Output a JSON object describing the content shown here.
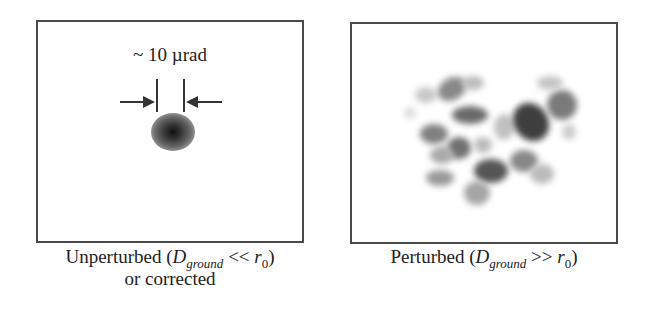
{
  "left_panel": {
    "measurement_label": "~ 10 µrad",
    "caption": {
      "prefix": "Unperturbed (",
      "var_D": "D",
      "sub": "ground",
      "relation": " << ",
      "var_r": "r",
      "r_sub": "0",
      "suffix": ")",
      "line2": "or corrected"
    },
    "spot": "single diffraction-limited spot"
  },
  "right_panel": {
    "caption": {
      "prefix": "Perturbed (",
      "var_D": "D",
      "sub": "ground",
      "relation": " >> ",
      "var_r": "r",
      "r_sub": "0",
      "suffix": ")"
    },
    "pattern": "speckle pattern"
  }
}
